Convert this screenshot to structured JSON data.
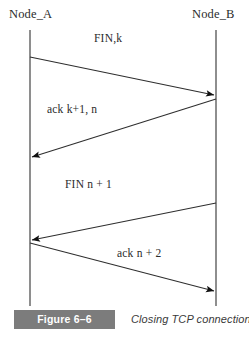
{
  "figure": {
    "number_label": "Figure 6–6",
    "caption": "Closing TCP connections.",
    "number_box_color": "#7c7c7c",
    "number_text_color": "#ffffff",
    "line_color": "#3a3a3a"
  },
  "diagram": {
    "type": "sequence-diagram",
    "nodes": [
      {
        "id": "node_a",
        "label": "Node_A",
        "lifeline_x": 30
      },
      {
        "id": "node_b",
        "label": "Node_B",
        "lifeline_x": 216
      }
    ],
    "lifeline_top": 30,
    "lifeline_bottom": 306,
    "messages": [
      {
        "label": "FIN,k",
        "from": "node_a",
        "to": "node_b",
        "direction": "right",
        "x1": 30,
        "y1": 57,
        "x2": 214,
        "y2": 95
      },
      {
        "label": "ack k+1,  n",
        "from": "node_b",
        "to": "node_a",
        "direction": "left",
        "x1": 216,
        "y1": 99,
        "x2": 32,
        "y2": 157
      },
      {
        "label": "FIN n + 1",
        "from": "node_b",
        "to": "node_a",
        "direction": "left",
        "x1": 216,
        "y1": 203,
        "x2": 32,
        "y2": 240
      },
      {
        "label": "ack n + 2",
        "from": "node_a",
        "to": "node_b",
        "direction": "right",
        "x1": 30,
        "y1": 243,
        "x2": 214,
        "y2": 291
      }
    ]
  }
}
